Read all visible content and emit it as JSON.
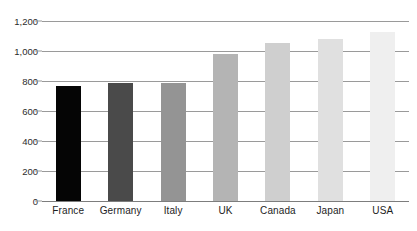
{
  "chart_data": {
    "type": "bar",
    "title": "",
    "subtitle": "",
    "xlabel": "",
    "ylabel": "",
    "categories": [
      "France",
      "Germany",
      "Italy",
      "UK",
      "Canada",
      "Japan",
      "USA"
    ],
    "values": [
      770,
      785,
      790,
      980,
      1055,
      1080,
      1130
    ],
    "series": [
      {
        "name": "",
        "values": [
          770,
          785,
          790,
          980,
          1055,
          1080,
          1130
        ]
      }
    ],
    "bar_colors": [
      "#050505",
      "#4a4a4a",
      "#949494",
      "#b4b4b4",
      "#cfcfcf",
      "#e0e0e0",
      "#efefef"
    ],
    "ylim": [
      0,
      1200
    ],
    "yticks": [
      0,
      200,
      400,
      600,
      800,
      1000,
      1200
    ],
    "ytick_labels": [
      "0",
      "200",
      "400",
      "600",
      "800",
      "1,000",
      "1,200"
    ],
    "grid": true,
    "gridline_color": "#9a9a9a",
    "legend": null,
    "legend_position": "none",
    "background_color": "#ffffff",
    "axis_label_color": "#1d1d1d"
  }
}
